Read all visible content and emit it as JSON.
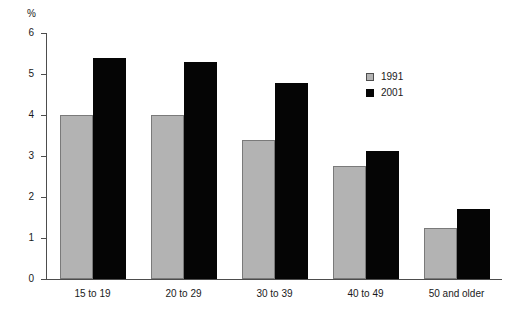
{
  "chart_data": {
    "type": "bar",
    "title": "",
    "xlabel": "",
    "ylabel": "%",
    "ylim": [
      0,
      6
    ],
    "yticks": [
      0,
      1,
      2,
      3,
      4,
      5,
      6
    ],
    "grid": false,
    "legend_position": "upper-right",
    "categories": [
      "15 to 19",
      "20 to 29",
      "30 to 39",
      "40 to 49",
      "50 and older"
    ],
    "series": [
      {
        "name": "1991",
        "color": "#b3b3b3",
        "values": [
          4.0,
          4.0,
          3.38,
          2.75,
          1.25
        ]
      },
      {
        "name": "2001",
        "color": "#050505",
        "values": [
          5.4,
          5.3,
          4.77,
          3.13,
          1.7
        ]
      }
    ]
  }
}
